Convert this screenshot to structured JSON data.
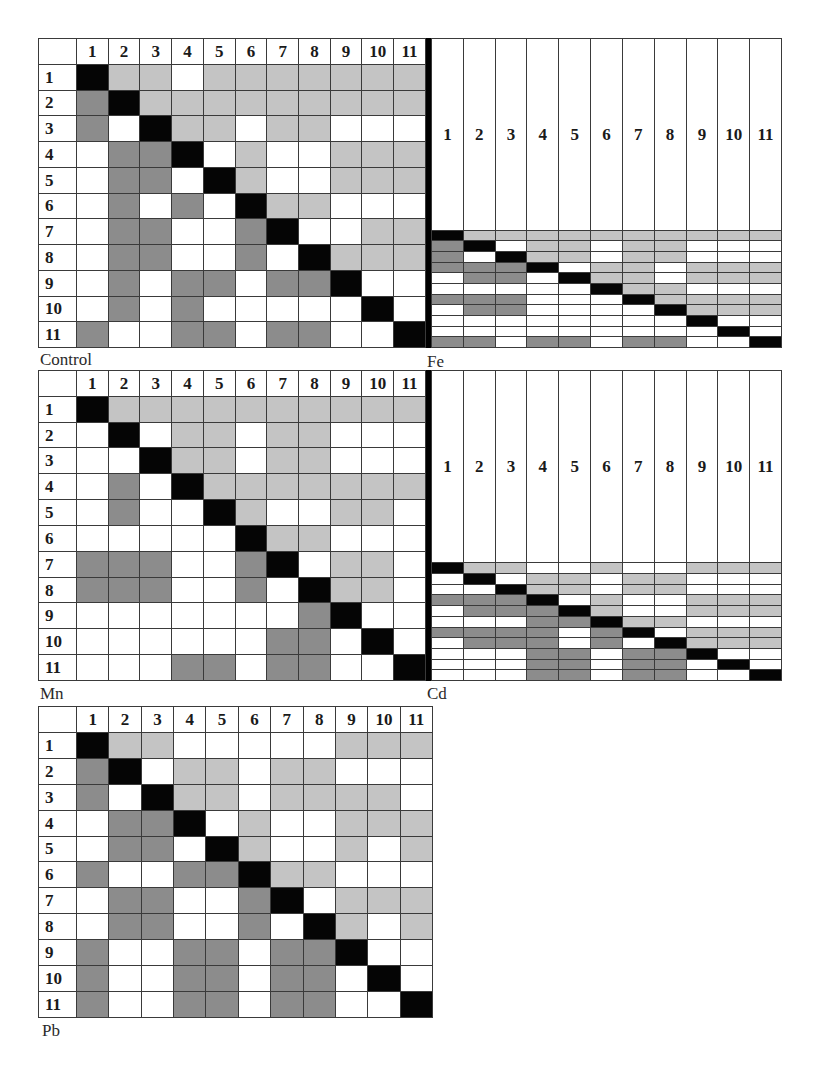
{
  "legend": {
    "B": "diagonal (self)",
    "L": "light gray cell (upper triangle)",
    "D": "dark gray cell (lower triangle)",
    "W": "white cell"
  },
  "colors": {
    "black": "#050505",
    "light_gray": "#c4c4c4",
    "dark_gray": "#8c8c8c",
    "white": "#ffffff",
    "grid": "#3a3a3a"
  },
  "chart_data": {
    "type": "heatmap",
    "title": "",
    "labels": [
      "1",
      "2",
      "3",
      "4",
      "5",
      "6",
      "7",
      "8",
      "9",
      "10",
      "11"
    ],
    "matrices": [
      {
        "name": "Control",
        "rows": [
          "BLLWLLLLLLL",
          "DBLLLLLLLLL",
          "DWBLLWLLWWW",
          "WDDBWLWWLLL",
          "WDDWBLWWLLL",
          "WDWDWBLLWWW",
          "WDDWWDBWWLL",
          "WDDWWDWBLLL",
          "WDWDDWDDBWW",
          "WDWDWWWWWBW",
          "DWWDDWDDWWB"
        ]
      },
      {
        "name": "Fe",
        "rows": [
          "BLLLLLLLLLL",
          "DBWLLWLLWWW",
          "DWBLLWLLWWW",
          "DDDBWLLWLLL",
          "WDDWBLLWLLL",
          "WWWWWBLLWWW",
          "DDDWWWBLLLL",
          "WDDWWWWBLLL",
          "WWWWWWWWBWW",
          "WWWWWWWWWBW",
          "DDWDDWDDWWB"
        ]
      },
      {
        "name": "Mn",
        "rows": [
          "BLLLLLLLLLL",
          "WBWLLWLLWWW",
          "WWBLLWLLWWW",
          "WDWBLLLLLLL",
          "WDWWBLWWLLW",
          "WWWWWBLLWWW",
          "DDDWWDBWLLW",
          "DDDWWDWBLLW",
          "WWWWWWWDBWW",
          "WWWWWWDDWBW",
          "WWWDDWDDWWB"
        ]
      },
      {
        "name": "Cd",
        "rows": [
          "BLLWWLWWLLL",
          "WBWLLWLLWWW",
          "WWBLLWLLWWW",
          "DDDBWLWWLLL",
          "WDDDBLWWLLL",
          "WWWDDBLLWWW",
          "DDDDWDBWLLL",
          "WDDDWDWBLLL",
          "WWWDDWDDBWW",
          "WWWDDWDDWBW",
          "WWWDDWDDWWB"
        ]
      },
      {
        "name": "Pb",
        "rows": [
          "BLLWWWWWLLL",
          "DBWLLWLLWWW",
          "DWBLLWLLLLW",
          "WDDBWLWWLLL",
          "WDDWBLWWLWL",
          "DWWDDBLLWWW",
          "WDDWWDBWLLL",
          "WDDWWDWBLWL",
          "DWWDDWDDBWW",
          "DWWDDWDDWBW",
          "DWWDDWDDWWB"
        ]
      }
    ]
  },
  "panels": [
    {
      "label": "Control"
    },
    {
      "label": "Fe"
    },
    {
      "label": "Mn"
    },
    {
      "label": "Cd"
    },
    {
      "label": "Pb"
    }
  ]
}
